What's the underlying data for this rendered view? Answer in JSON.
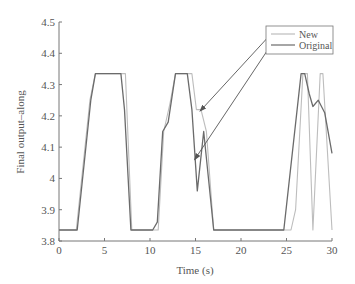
{
  "chart_data": {
    "type": "line",
    "title": "",
    "xlabel": "Time (s)",
    "ylabel": "Final output–along",
    "xlim": [
      0,
      30
    ],
    "ylim": [
      3.8,
      4.5
    ],
    "xticks": [
      0,
      5,
      10,
      15,
      20,
      25,
      30
    ],
    "xtick_labels": [
      "0",
      "5",
      "10",
      "15",
      "20",
      "25",
      "30"
    ],
    "yticks": [
      3.8,
      3.9,
      4.0,
      4.1,
      4.2,
      4.3,
      4.4,
      4.5
    ],
    "ytick_labels": [
      "3.8",
      "3.9",
      "4",
      "4.1",
      "4.2",
      "4.3",
      "4.4",
      "4.5"
    ],
    "grid": false,
    "legend_position": "upper right",
    "legend": [
      "New",
      "Original"
    ],
    "series": [
      {
        "name": "New",
        "color": "#bdbdbd",
        "x": [
          0,
          1.9,
          3.4,
          4.0,
          7.3,
          8.0,
          10.9,
          11.5,
          12.2,
          12.8,
          14.6,
          15.1,
          15.6,
          16.2,
          17.0,
          25.5,
          26.0,
          26.8,
          27.3,
          27.9,
          28.7,
          29.0,
          30.0
        ],
        "values": [
          3.835,
          3.835,
          4.25,
          4.335,
          4.335,
          3.835,
          3.835,
          4.15,
          4.24,
          4.335,
          4.335,
          4.22,
          4.22,
          4.15,
          3.835,
          3.835,
          3.9,
          4.335,
          4.335,
          3.835,
          4.335,
          4.335,
          3.835
        ]
      },
      {
        "name": "Original",
        "color": "#6b6b6b",
        "x": [
          0,
          2.0,
          3.5,
          4.0,
          6.8,
          7.2,
          7.9,
          10.3,
          10.8,
          11.4,
          12.0,
          12.8,
          14.1,
          14.6,
          15.2,
          15.9,
          17.0,
          24.7,
          26.6,
          27.0,
          27.5,
          27.9,
          28.5,
          29.2,
          30.0
        ],
        "values": [
          3.835,
          3.835,
          4.25,
          4.335,
          4.335,
          4.22,
          3.835,
          3.835,
          3.86,
          4.15,
          4.18,
          4.335,
          4.335,
          4.22,
          3.96,
          4.15,
          3.835,
          3.835,
          4.335,
          4.335,
          4.27,
          4.23,
          4.25,
          4.21,
          4.08
        ]
      }
    ],
    "annotations": [
      {
        "type": "arrow",
        "from_legend": "New",
        "to": [
          15.5,
          4.215
        ]
      },
      {
        "type": "arrow",
        "from_legend": "Original",
        "to": [
          14.9,
          4.06
        ]
      }
    ]
  },
  "colors": {
    "axis": "#777777",
    "text": "#555555",
    "new_line": "#bdbdbd",
    "original_line": "#6b6b6b",
    "arrow": "#555555"
  }
}
